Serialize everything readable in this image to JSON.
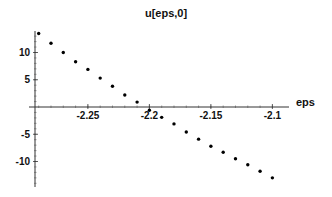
{
  "chart_data": {
    "type": "scatter",
    "title": "u[eps,0]",
    "xlabel": "eps",
    "ylabel": "",
    "x_ticks": [
      -2.25,
      -2.2,
      -2.15,
      -2.1
    ],
    "x_tick_labels": [
      "-2.25",
      "-2.2",
      "-2.15",
      "-2.1"
    ],
    "y_ticks": [
      -10,
      -5,
      5,
      10
    ],
    "y_tick_labels": [
      "-10",
      "-5",
      "5",
      "10"
    ],
    "xlim": [
      -2.293,
      -2.085
    ],
    "ylim": [
      -14.5,
      14
    ],
    "grid": false,
    "legend": null,
    "series": [
      {
        "name": "u[eps,0]",
        "x": [
          -2.29,
          -2.28,
          -2.27,
          -2.26,
          -2.25,
          -2.24,
          -2.23,
          -2.22,
          -2.21,
          -2.2,
          -2.19,
          -2.18,
          -2.17,
          -2.16,
          -2.15,
          -2.14,
          -2.13,
          -2.12,
          -2.11,
          -2.1
        ],
        "y": [
          13.5,
          11.7,
          10.0,
          8.3,
          6.9,
          5.3,
          3.8,
          2.2,
          0.9,
          -0.6,
          -1.9,
          -3.1,
          -4.6,
          -5.9,
          -7.2,
          -8.3,
          -9.5,
          -10.6,
          -11.8,
          -13.0
        ]
      }
    ]
  }
}
